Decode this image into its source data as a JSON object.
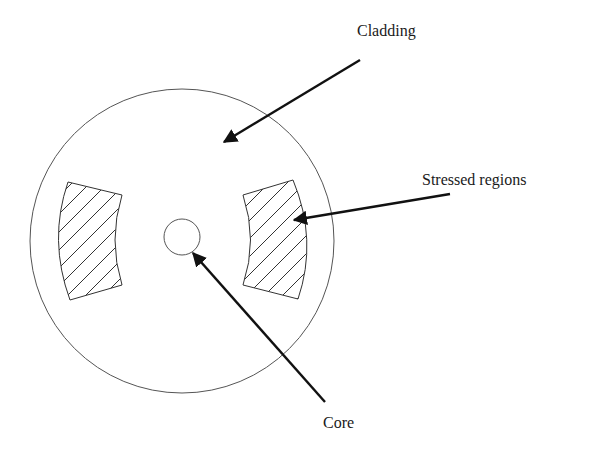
{
  "diagram": {
    "labels": {
      "cladding": "Cladding",
      "stressed_regions": "Stressed regions",
      "core": "Core"
    },
    "colors": {
      "background": "#ffffff",
      "outline": "#555555",
      "arrow": "#111111",
      "text": "#1a1a1a"
    }
  }
}
